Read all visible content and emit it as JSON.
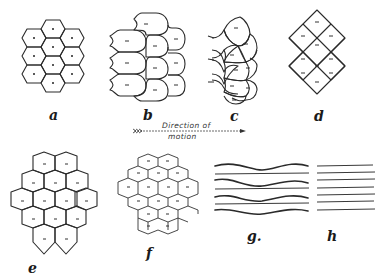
{
  "figure": {
    "panels": [
      {
        "id": "a",
        "label": "a",
        "description": "regular hexagonal cells with central dots"
      },
      {
        "id": "b",
        "label": "b",
        "description": "bullet-shaped cells with dash markers, rounded to the right"
      },
      {
        "id": "c",
        "label": "c",
        "description": "overlapping scale-like cells with dash markers"
      },
      {
        "id": "d",
        "label": "d",
        "description": "diamond lattice cells with dash markers"
      },
      {
        "id": "e",
        "label": "e",
        "description": "elongated hexagonal cells with dash markers"
      },
      {
        "id": "f",
        "label": "f",
        "description": "flattened hexagonal cells with dash markers"
      },
      {
        "id": "g",
        "label": "g.",
        "description": "alternating wavy and straight horizontal lines"
      },
      {
        "id": "h",
        "label": "h",
        "description": "parallel straight horizontal lines"
      }
    ],
    "arrow": {
      "caption_line1": "Direction of",
      "caption_line2": "motion"
    }
  }
}
